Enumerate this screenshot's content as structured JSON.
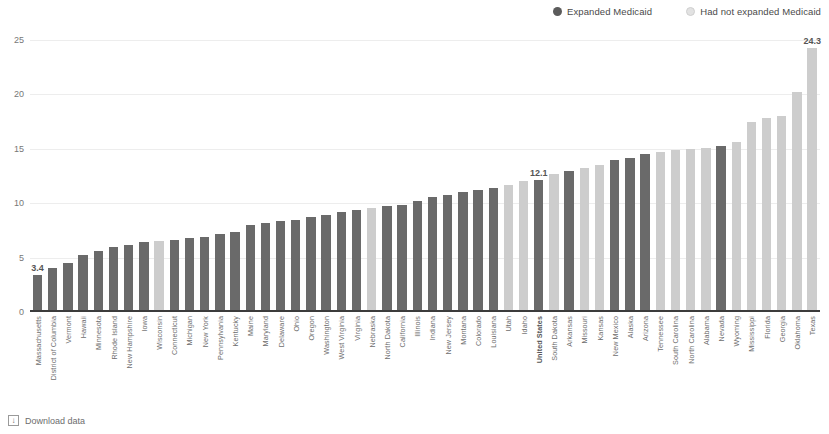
{
  "legend": {
    "position": "top-right",
    "items": [
      {
        "label": "Expanded Medicaid",
        "color": "#6a6a6a",
        "marker": "legend-dot-dark"
      },
      {
        "label": "Had not expanded Medicaid",
        "color": "#cdcdcd",
        "marker": "legend-dot-light"
      }
    ]
  },
  "footer": {
    "download_label": "Download data",
    "download_icon": "download-icon",
    "icon_glyph": "↓"
  },
  "chart_data": {
    "type": "bar",
    "title": "",
    "subtitle": "",
    "xlabel": "",
    "ylabel": "",
    "ylim": [
      0,
      25
    ],
    "yticks": [
      25,
      20,
      15,
      10,
      5,
      0
    ],
    "grid": true,
    "legend_position": "top-right",
    "series": [
      {
        "name": "Expanded Medicaid",
        "color": "#6a6a6a"
      },
      {
        "name": "Had not expanded Medicaid",
        "color": "#cdcdcd"
      }
    ],
    "value_labels": {
      "Massachusetts": "3.4",
      "United States": "12.1",
      "Texas": "24.3"
    },
    "categories": [
      "Massachusetts",
      "District of Columbia",
      "Vermont",
      "Hawaii",
      "Minnesota",
      "Rhode Island",
      "New Hampshire",
      "Iowa",
      "Wisconsin",
      "Connecticut",
      "Michigan",
      "New York",
      "Pennsylvania",
      "Kentucky",
      "Maine",
      "Maryland",
      "Delaware",
      "Ohio",
      "Oregon",
      "Washington",
      "West Virginia",
      "Virginia",
      "Nebraska",
      "North Dakota",
      "California",
      "Illinois",
      "Indiana",
      "New Jersey",
      "Montana",
      "Colorado",
      "Louisiana",
      "Utah",
      "Idaho",
      "United States",
      "South Dakota",
      "Arkansas",
      "Missouri",
      "Kansas",
      "New Mexico",
      "Alaska",
      "Arizona",
      "Tennessee",
      "South Carolina",
      "North Carolina",
      "Alabama",
      "Nevada",
      "Wyoming",
      "Mississippi",
      "Florida",
      "Georgia",
      "Oklahoma",
      "Texas"
    ],
    "values": [
      3.4,
      4.0,
      4.5,
      5.2,
      5.6,
      6.0,
      6.2,
      6.4,
      6.5,
      6.6,
      6.8,
      6.9,
      7.2,
      7.4,
      8.0,
      8.2,
      8.4,
      8.5,
      8.7,
      8.9,
      9.2,
      9.4,
      9.6,
      9.7,
      9.8,
      10.2,
      10.6,
      10.8,
      11.0,
      11.2,
      11.4,
      11.7,
      12.0,
      12.1,
      12.7,
      13.0,
      13.2,
      13.5,
      14.0,
      14.2,
      14.5,
      14.7,
      14.9,
      15.0,
      15.1,
      15.3,
      15.6,
      17.5,
      17.8,
      18.0,
      20.2,
      24.3
    ],
    "expanded": [
      true,
      true,
      true,
      true,
      true,
      true,
      true,
      true,
      false,
      true,
      true,
      true,
      true,
      true,
      true,
      true,
      true,
      true,
      true,
      true,
      true,
      true,
      false,
      true,
      true,
      true,
      true,
      true,
      true,
      true,
      true,
      false,
      false,
      true,
      false,
      true,
      false,
      false,
      true,
      true,
      true,
      false,
      false,
      false,
      false,
      true,
      false,
      false,
      false,
      false,
      false,
      false
    ],
    "emphasis_categories": [
      "United States"
    ]
  }
}
